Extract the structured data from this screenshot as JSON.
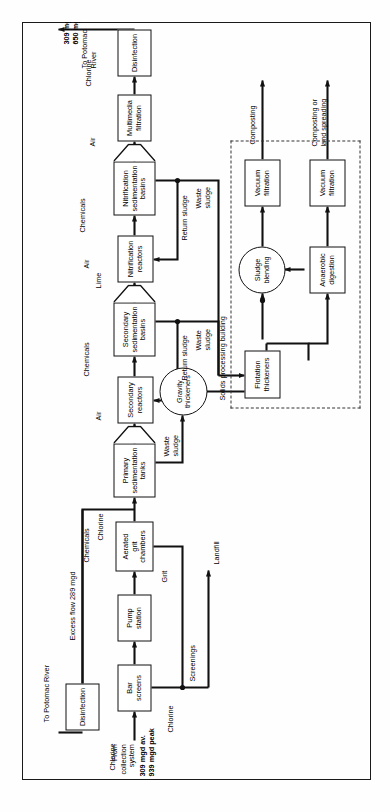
{
  "diagram": {
    "orientation": "rotated-90",
    "frame_color": "#1a1a1a"
  },
  "inflow": {
    "source_label": "From\ncollection\nsystem",
    "flow_label": "309 mgd av.\n939 mgd peak",
    "chlorine_label": "Chlorine"
  },
  "liquid_train": [
    {
      "id": "bar-screens",
      "label": "Bar\nscreens",
      "shape": "rect"
    },
    {
      "id": "pump-station",
      "label": "Pump\nstation",
      "shape": "rect"
    },
    {
      "id": "aerated-grit-chambers",
      "label": "Aerated\ngrit\nchambers",
      "shape": "rect"
    },
    {
      "id": "primary-sedimentation-tanks",
      "label": "Primary\nsedimentation\ntanks",
      "shape": "hopper"
    },
    {
      "id": "secondary-reactors",
      "label": "Secondary\nreactors",
      "shape": "rect"
    },
    {
      "id": "secondary-sedimentation-basins",
      "label": "Secondary\nsedimentation\nbasins",
      "shape": "hopper"
    },
    {
      "id": "nitrification-reactors",
      "label": "Nitrification\nreactors",
      "shape": "rect"
    },
    {
      "id": "nitrification-sedimentation-basins",
      "label": "Nitrification\nsedimentation\nbasins",
      "shape": "hopper"
    },
    {
      "id": "multimedia-filtration",
      "label": "Multimedia\nfiltration",
      "shape": "rect"
    },
    {
      "id": "disinfection-main",
      "label": "Disinfection",
      "shape": "rect"
    }
  ],
  "excess_train": [
    {
      "id": "disinfection-excess",
      "label": "Disinfection",
      "shape": "rect"
    }
  ],
  "solids_train": [
    {
      "id": "gravity-thickeners",
      "label": "Gravity\nthickeners",
      "shape": "circle"
    },
    {
      "id": "flotation-thickeners",
      "label": "Flotation\nthickeners",
      "shape": "rect"
    },
    {
      "id": "sludge-blending",
      "label": "Sludge\nblending",
      "shape": "circle"
    },
    {
      "id": "anaerobic-digestion",
      "label": "Anaerobic\ndigestion",
      "shape": "rect"
    },
    {
      "id": "vacuum-filtration-top",
      "label": "Vacuum\nfiltration",
      "shape": "rect"
    },
    {
      "id": "vacuum-filtration-bottom",
      "label": "Vacuum\nfiltration",
      "shape": "rect"
    }
  ],
  "chemical_feeds": {
    "chlorine_inlet": "Chlorine",
    "chemicals_grit": "Chemicals",
    "chlorine_grit": "Chlorine",
    "chlorine_excess": "Chlorine",
    "air_secondary": "Air",
    "chemicals_secondary": "Chemicals",
    "lime_nitrification": "Lime",
    "air_nitrification": "Air",
    "chemicals_nitrification": "Chemicals",
    "air_filtration": "Air",
    "chlorine_disinfection": "Chlorine"
  },
  "stream_labels": {
    "screenings": "Screenings",
    "grit": "Grit",
    "landfill": "Landfill",
    "waste_sludge_primary": "Waste\nsludge",
    "waste_sludge_secondary": "Waste\nsludge",
    "waste_sludge_nitrification": "Waste\nsludge",
    "return_sludge_secondary": "Return sludge",
    "return_sludge_nitrification": "Return sludge",
    "excess_flow": "Excess flow 289 mgd",
    "to_potomac_excess": "To Potomac River",
    "to_potomac_main": "To Potomac\nRiver",
    "main_effluent_flow": "309 mgd av.\n650 mgd peak",
    "composting": "Composting",
    "composting_or_land_spreading": "Composting or\nland spreading",
    "solids_processing_building": "Solids processing building"
  }
}
